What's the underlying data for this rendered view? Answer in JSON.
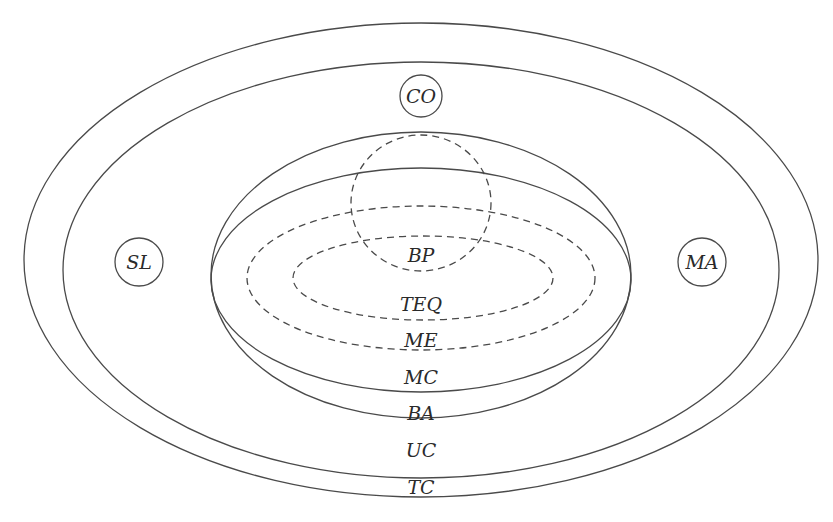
{
  "diagram": {
    "type": "nested-set-diagram",
    "sets": [
      {
        "id": "TC",
        "label": "TC",
        "style": "solid",
        "shape": "ellipse"
      },
      {
        "id": "UC",
        "label": "UC",
        "style": "solid",
        "shape": "ellipse"
      },
      {
        "id": "BA",
        "label": "BA",
        "style": "solid",
        "shape": "ellipse"
      },
      {
        "id": "MC",
        "label": "MC",
        "style": "solid",
        "shape": "ellipse"
      },
      {
        "id": "ME",
        "label": "ME",
        "style": "dashed",
        "shape": "ellipse"
      },
      {
        "id": "TEQ",
        "label": "TEQ",
        "style": "dashed",
        "shape": "ellipse"
      },
      {
        "id": "BP",
        "label": "BP",
        "style": "dashed",
        "shape": "circle"
      }
    ],
    "points": [
      {
        "id": "CO",
        "label": "CO"
      },
      {
        "id": "SL",
        "label": "SL"
      },
      {
        "id": "MA",
        "label": "MA"
      }
    ],
    "labels": {
      "tc": "TC",
      "uc": "UC",
      "ba": "BA",
      "mc": "MC",
      "me": "ME",
      "teq": "TEQ",
      "bp": "BP",
      "co": "CO",
      "sl": "SL",
      "ma": "MA"
    },
    "colors": {
      "stroke": "#4a4a4a",
      "text": "#2a2a2a",
      "background": "#ffffff"
    }
  }
}
